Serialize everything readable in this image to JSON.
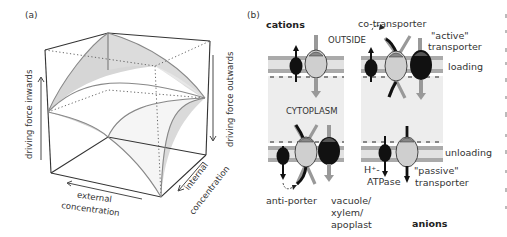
{
  "panel_a": {
    "label": "(a)",
    "axis_inwards": "driving force inwards",
    "axis_outwards": "driving force outwards",
    "axis_external_line1": "external",
    "axis_external_line2": "concentration",
    "axis_internal_line1": "internal",
    "axis_internal_line2": "concentration"
  },
  "panel_b": {
    "label": "(b)",
    "cations": "cations",
    "anions": "anions",
    "outside": "OUTSIDE",
    "cytoplasm": "CYTOPLASM",
    "co_transporter": "co-transporter",
    "active_transporter_line1": "\"active\"",
    "active_transporter_line2": "transporter",
    "loading": "loading",
    "unloading": "unloading",
    "h_atpase_line1": "H⁺-",
    "h_atpase_line2": "ATPase",
    "passive_transporter_line1": "\"passive\"",
    "passive_transporter_line2": "transporter",
    "anti_porter": "anti-porter",
    "vacuole_line1": "vacuole/",
    "vacuole_line2": "xylem/",
    "vacuole_line3": "apoplast"
  },
  "colors": {
    "membrane": "#a9a9a9",
    "cytoplasm": "#ececec",
    "transporter_light": "#cfcfcf",
    "transporter_dark": "#111111",
    "surface_shade": "#d4d4d4"
  }
}
